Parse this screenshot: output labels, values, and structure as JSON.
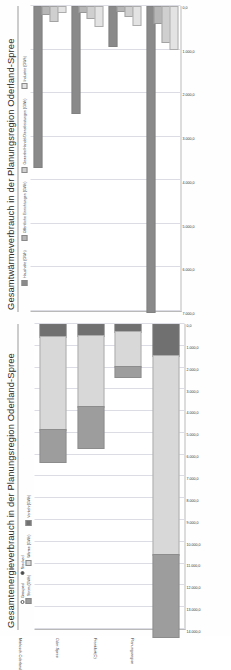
{
  "page": {
    "orientation": "rotated-90-ccw",
    "background": "#fdfdfd"
  },
  "charts": [
    {
      "id": "waermeverbrauch",
      "title": "Gesamtwärmeverbrauch in der Planungsregion Oderland-Spree",
      "legend": [
        {
          "label": "Haushalte (GWh)",
          "color": "#8a8a8a"
        },
        {
          "label": "Öffentliche Einrichtungen (GWh)",
          "color": "#b6b6b6"
        },
        {
          "label": "Gewerbe/Handel/Dienstleistungen (GWh)",
          "color": "#cfcfcf"
        },
        {
          "label": "Industrie (GWh)",
          "color": "#e3e3e3"
        }
      ],
      "chart_data": {
        "type": "bar",
        "orientation": "horizontal",
        "title": "Gesamtwärmeverbrauch in der Planungsregion Oderland-Spree",
        "xlabel": "",
        "ylabel": "",
        "categories": [
          "Märkisch-Oderland",
          "Oder-Spree",
          "Frankfurt(O)",
          "Planungsregion"
        ],
        "ticklabels": [
          "7.000,0",
          "6.000,0",
          "5.000,0",
          "4.000,0",
          "3.000,0",
          "2.000,0",
          "1.000,0",
          "0,0"
        ],
        "xlim": [
          0,
          7000
        ],
        "grid": true,
        "legend_position": "top-left",
        "series": [
          {
            "name": "Haushalte (GWh)",
            "color": "#8a8a8a",
            "values": [
              3680,
              2430,
              900,
              7010
            ]
          },
          {
            "name": "Öffentliche Einrichtungen (GWh)",
            "color": "#b6b6b6",
            "values": [
              150,
              120,
              90,
              360
            ]
          },
          {
            "name": "Gewerbe/Handel/Dienstleistungen (GWh)",
            "color": "#cfcfcf",
            "values": [
              330,
              260,
              210,
              800
            ]
          },
          {
            "name": "Industrie (GWh)",
            "color": "#e3e3e3",
            "values": [
              120,
              430,
              420,
              970
            ]
          }
        ]
      }
    },
    {
      "id": "energieverbrauch",
      "title": "Gesamtenergieverbrauch in der Planungsregion Oderland-Spree",
      "modes": [
        {
          "label": "Grouped",
          "selected": false
        },
        {
          "label": "Stacked",
          "selected": true
        }
      ],
      "legend": [
        {
          "label": "Strom (GWh)",
          "color": "#9d9d9d"
        },
        {
          "label": "Wärme (GWh)",
          "color": "#d8d8d8"
        },
        {
          "label": "Verkehr(GWh)",
          "color": "#707070"
        }
      ],
      "chart_data": {
        "type": "bar",
        "stacked": true,
        "orientation": "horizontal",
        "title": "Gesamtenergieverbrauch in der Planungsregion Oderland-Spree",
        "xlabel": "",
        "ylabel": "",
        "categories": [
          "Märkisch-Oderland",
          "Oder-Spree",
          "Frankfurt(O)",
          "Planungsregion"
        ],
        "ticklabels": [
          "14.000,0",
          "13.000,0",
          "12.000,0",
          "11.000,0",
          "10.000,0",
          "9.000,0",
          "8.000,0",
          "7.000,0",
          "6.000,0",
          "5.000,0",
          "4.000,0",
          "3.000,0",
          "2.000,0",
          "1.000,0",
          "0,0"
        ],
        "xlim": [
          0,
          14000
        ],
        "grid": true,
        "legend_position": "top-left",
        "series": [
          {
            "name": "Verkehr(GWh)",
            "color": "#707070",
            "values": [
              560,
              520,
              330,
              1410
            ]
          },
          {
            "name": "Wärme (GWh)",
            "color": "#d8d8d8",
            "values": [
              4280,
              3240,
              1620,
              9140
            ]
          },
          {
            "name": "Strom (GWh)",
            "color": "#9d9d9d",
            "values": [
              1470,
              1890,
              430,
              3790
            ]
          }
        ]
      }
    }
  ]
}
